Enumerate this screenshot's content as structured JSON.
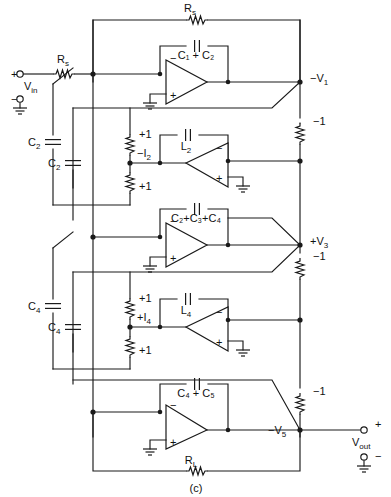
{
  "figure": {
    "caption": "(c)",
    "type": "active-filter-ladder-schematic"
  },
  "ports": {
    "input": {
      "label": "V",
      "sub": "in",
      "plus": "+",
      "minus": "−"
    },
    "output": {
      "label": "V",
      "sub": "out",
      "plus": "+",
      "minus": "−"
    }
  },
  "components": {
    "source_resistor_top": "R",
    "source_resistor_top_sub": "s",
    "source_resistor_in": "R",
    "source_resistor_in_sub": "s",
    "load_resistor": "R",
    "load_resistor_sub": "L",
    "feedback_cap_1": "C₁ + C₂",
    "inductor_2": "L",
    "inductor_2_sub": "2",
    "feedback_cap_3": "C₂+C₃+C₄",
    "inductor_4": "L",
    "inductor_4_sub": "4",
    "feedback_cap_5": "C₄ + C₅",
    "cap_c2_upper": "C",
    "cap_c2_upper_sub": "2",
    "cap_c2_lower": "C",
    "cap_c2_lower_sub": "2",
    "cap_c4_upper": "C",
    "cap_c4_upper_sub": "4",
    "cap_c4_lower": "C",
    "cap_c4_lower_sub": "4"
  },
  "nodes": {
    "v1": "−V",
    "v1_sub": "1",
    "v3": "+V",
    "v3_sub": "3",
    "v5": "−V",
    "v5_sub": "5",
    "i2": "−I",
    "i2_sub": "2",
    "i4": "+I",
    "i4_sub": "4"
  },
  "gains": {
    "unity_pos_a": "+1",
    "unity_pos_b": "+1",
    "unity_pos_c": "+1",
    "unity_pos_d": "+1",
    "unity_neg_1": "−1",
    "unity_neg_2": "−1",
    "unity_neg_3": "−1"
  },
  "opamps": {
    "a1_minus": "−",
    "a1_plus": "+",
    "a2_minus": "−",
    "a2_plus": "+",
    "a3_minus": "−",
    "a3_plus": "+",
    "a4_minus": "−",
    "a4_plus": "+",
    "a5_minus": "−",
    "a5_plus": "+"
  },
  "colors": {
    "ink": "#1a1a1a",
    "paper": "#ffffff"
  }
}
